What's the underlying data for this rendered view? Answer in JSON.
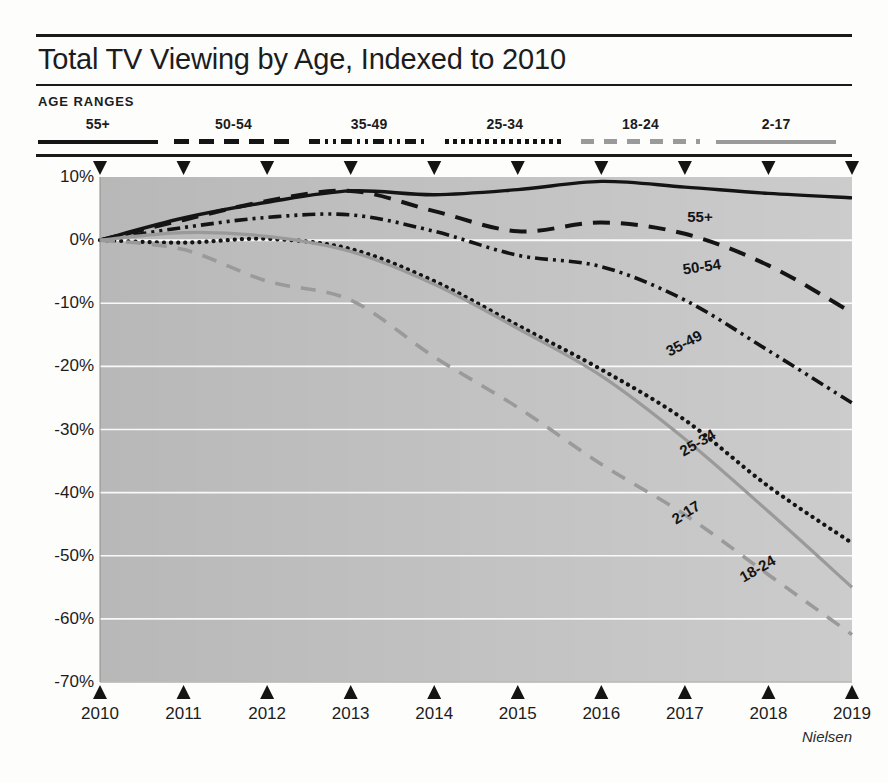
{
  "header": {
    "title": "Total TV Viewing by Age, Indexed to 2010",
    "legend_heading": "AGE RANGES"
  },
  "legend": {
    "items": [
      {
        "label": "55+",
        "style": "solid-dark",
        "color": "#141414"
      },
      {
        "label": "50-54",
        "style": "dash-dark",
        "color": "#141414"
      },
      {
        "label": "35-49",
        "style": "dashdotdot",
        "color": "#141414"
      },
      {
        "label": "25-34",
        "style": "dot-dark",
        "color": "#141414"
      },
      {
        "label": "18-24",
        "style": "dash-gray",
        "color": "#9a9a9a"
      },
      {
        "label": "2-17",
        "style": "solid-gray",
        "color": "#9a9a9a"
      }
    ]
  },
  "source": "Nielsen",
  "chart_data": {
    "type": "line",
    "title": "Total TV Viewing by Age, Indexed to 2010",
    "xlabel": "",
    "ylabel": "",
    "ylim": [
      -70,
      10
    ],
    "xlim": [
      2010,
      2019
    ],
    "ytick_labels": [
      "10%",
      "0%",
      "-10%",
      "-20%",
      "-30%",
      "-40%",
      "-50%",
      "-60%",
      "-70%"
    ],
    "ytick_values": [
      10,
      0,
      -10,
      -20,
      -30,
      -40,
      -50,
      -60,
      -70
    ],
    "grid": "horizontal-white",
    "legend_position": "top",
    "plot_background": "#b8b8b8",
    "x": [
      2010,
      2011,
      2012,
      2013,
      2014,
      2015,
      2016,
      2017,
      2018,
      2019
    ],
    "categories": [
      "2010",
      "2011",
      "2012",
      "2013",
      "2014",
      "2015",
      "2016",
      "2017",
      "2018",
      "2019"
    ],
    "series": [
      {
        "name": "55+",
        "style": "solid-dark",
        "color": "#141414",
        "values": [
          0,
          3.5,
          6.0,
          7.8,
          7.2,
          8.0,
          9.3,
          8.4,
          7.4,
          6.7
        ]
      },
      {
        "name": "50-54",
        "style": "dash-dark",
        "color": "#141414",
        "values": [
          0,
          3.2,
          6.2,
          7.8,
          4.6,
          1.4,
          2.8,
          1.0,
          -4.0,
          -11.5
        ]
      },
      {
        "name": "35-49",
        "style": "dashdotdot",
        "color": "#141414",
        "values": [
          0,
          2.0,
          3.6,
          4.0,
          1.4,
          -2.4,
          -4.2,
          -9.5,
          -17.5,
          -25.8
        ]
      },
      {
        "name": "25-34",
        "style": "dot-dark",
        "color": "#141414",
        "values": [
          0,
          -0.4,
          0.2,
          -1.4,
          -6.5,
          -13.5,
          -20.5,
          -28.5,
          -39.0,
          -48.0
        ]
      },
      {
        "name": "18-24",
        "style": "dash-gray",
        "color": "#9a9a9a",
        "values": [
          0,
          -1.5,
          -6.5,
          -9.5,
          -18.5,
          -26.5,
          -35.5,
          -43.5,
          -53.0,
          -62.5
        ]
      },
      {
        "name": "2-17",
        "style": "solid-gray",
        "color": "#9a9a9a",
        "values": [
          0,
          1.2,
          0.6,
          -1.8,
          -7.0,
          -14.0,
          -21.5,
          -31.5,
          -43.0,
          -55.0
        ]
      }
    ],
    "inline_labels": [
      {
        "text": "55+",
        "x": 700,
        "y": 216,
        "rotate": 0,
        "tone": "dark"
      },
      {
        "text": "50-54",
        "x": 702,
        "y": 269,
        "rotate": -8,
        "tone": "dark"
      },
      {
        "text": "35-49",
        "x": 686,
        "y": 352,
        "rotate": -28,
        "tone": "dark"
      },
      {
        "text": "25-34",
        "x": 700,
        "y": 452,
        "rotate": -30,
        "tone": "dark"
      },
      {
        "text": "2-17",
        "x": 688,
        "y": 520,
        "rotate": -32,
        "tone": "dark"
      },
      {
        "text": "18-24",
        "x": 760,
        "y": 578,
        "rotate": -30,
        "tone": "dark"
      }
    ]
  }
}
